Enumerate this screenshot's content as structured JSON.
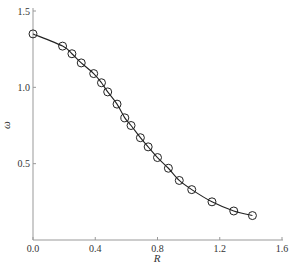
{
  "chart_data": {
    "type": "line",
    "title": "",
    "xlabel": "R",
    "ylabel": "ω",
    "xlim": [
      0.0,
      1.6
    ],
    "ylim": [
      0.0,
      1.5
    ],
    "xticks": [
      "0.0",
      "0.4",
      "0.8",
      "1.2",
      "1.6"
    ],
    "yticks": [
      "0.5",
      "1.0",
      "1.5"
    ],
    "grid": false,
    "legend": null,
    "series": [
      {
        "name": "ω(R)",
        "marker": "circle-open",
        "line": "solid",
        "color": "#222222",
        "x": [
          0.0,
          0.19,
          0.25,
          0.31,
          0.39,
          0.44,
          0.48,
          0.54,
          0.59,
          0.63,
          0.69,
          0.74,
          0.8,
          0.87,
          0.94,
          1.02,
          1.15,
          1.29,
          1.41
        ],
        "y": [
          1.35,
          1.27,
          1.22,
          1.16,
          1.09,
          1.03,
          0.97,
          0.89,
          0.8,
          0.75,
          0.67,
          0.61,
          0.54,
          0.47,
          0.39,
          0.33,
          0.25,
          0.19,
          0.16
        ]
      }
    ]
  },
  "axes": {
    "x_label": "R",
    "y_label": "ω",
    "x_ticks": [
      "0.0",
      "0.4",
      "0.8",
      "1.2",
      "1.6"
    ],
    "y_ticks": [
      "0.5",
      "1.0",
      "1.5"
    ]
  },
  "colors": {
    "axis": "#999999",
    "series": "#222222",
    "text": "#333333"
  }
}
